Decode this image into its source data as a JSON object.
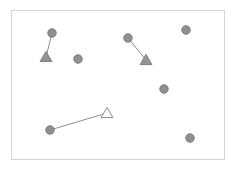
{
  "figure": {
    "title": "",
    "width": 235,
    "height": 171,
    "background_color": "#ffffff"
  },
  "frame": {
    "name": "plot-frame",
    "x": 11,
    "y": 10,
    "width": 213,
    "height": 149,
    "stroke_color": "#d5d5d5",
    "stroke_width": 1,
    "fill": "#ffffff"
  },
  "style": {
    "circle_fill": "#909090",
    "circle_stroke": "#7a7a7a",
    "circle_radius": 4.2,
    "filled_triangle_fill": "#949494",
    "filled_triangle_stroke": "#7e7e7e",
    "hollow_triangle_fill": "#ffffff",
    "hollow_triangle_stroke": "#8a8a8a",
    "triangle_size": 5.6,
    "link_stroke": "#8c8c8c",
    "link_width": 1
  },
  "chart_data": {
    "type": "scatter",
    "title": "",
    "xlabel": "",
    "ylabel": "",
    "xlim": [
      11,
      224
    ],
    "ylim": [
      10,
      159
    ],
    "grid": false,
    "legend": null,
    "axis_ticks": false,
    "series": [
      {
        "name": "circle-markers",
        "marker": "circle",
        "marker_style": "filled",
        "color": "#909090",
        "points": [
          {
            "id": "c1",
            "x": 52,
            "y": 33,
            "linked": true
          },
          {
            "id": "c2",
            "x": 128,
            "y": 38,
            "linked": true
          },
          {
            "id": "c3",
            "x": 50,
            "y": 130,
            "linked": true
          },
          {
            "id": "c4",
            "x": 78,
            "y": 59,
            "linked": false
          },
          {
            "id": "c5",
            "x": 186,
            "y": 30,
            "linked": false
          },
          {
            "id": "c6",
            "x": 164,
            "y": 89,
            "linked": false
          },
          {
            "id": "c7",
            "x": 190,
            "y": 138,
            "linked": false
          }
        ]
      },
      {
        "name": "triangle-markers",
        "marker": "triangle",
        "color": "#949494",
        "points": [
          {
            "id": "t1",
            "x": 46,
            "y": 57,
            "style": "filled"
          },
          {
            "id": "t2",
            "x": 146,
            "y": 60,
            "style": "filled"
          },
          {
            "id": "t3",
            "x": 107,
            "y": 113,
            "style": "hollow"
          }
        ]
      }
    ],
    "links": [
      {
        "id": "link1",
        "from": "c1",
        "to": "t1",
        "x1": 52,
        "y1": 33,
        "x2": 46,
        "y2": 57
      },
      {
        "id": "link2",
        "from": "c2",
        "to": "t2",
        "x1": 128,
        "y1": 38,
        "x2": 146,
        "y2": 60
      },
      {
        "id": "link3",
        "from": "c3",
        "to": "t3",
        "x1": 50,
        "y1": 130,
        "x2": 107,
        "y2": 113
      }
    ]
  }
}
